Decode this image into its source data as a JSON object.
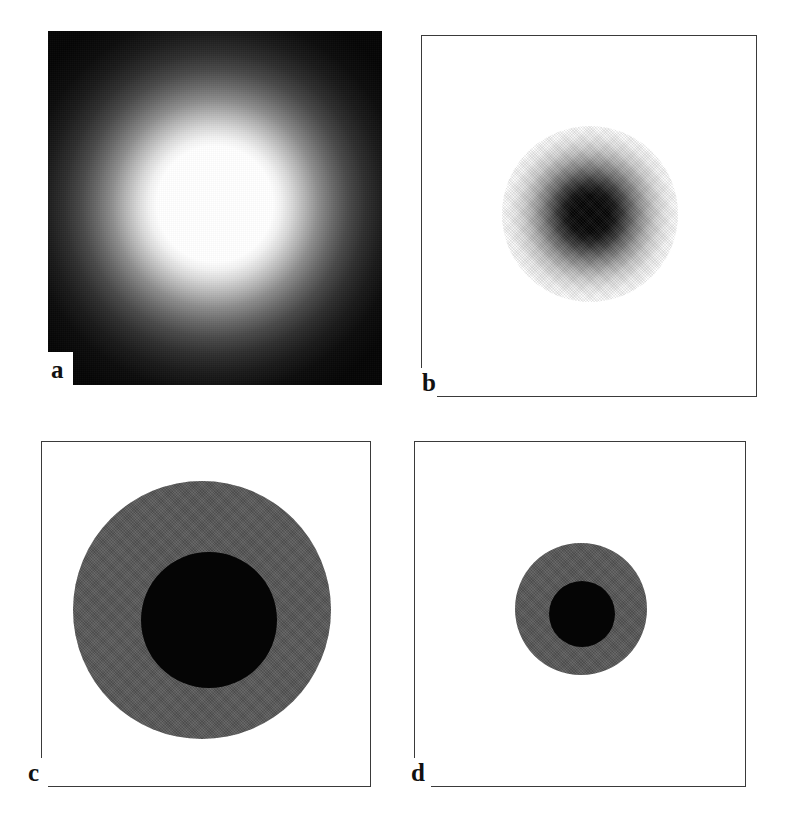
{
  "figure": {
    "panels": [
      {
        "id": "a",
        "label": "a",
        "description": "bright radially-symmetric Gaussian point-spread function rendered white-on-black",
        "background": "#050505",
        "peak_color": "#ffffff"
      },
      {
        "id": "b",
        "label": "b",
        "description": "contrast-inverted Gaussian: dark blob on white background inside a thin black frame",
        "background": "#ffffff",
        "peak_color": "#050505"
      },
      {
        "id": "c",
        "label": "c",
        "description": "two-level quantized disk: large gray annulus enclosing a black core",
        "background": "#ffffff",
        "ring_color": "#585858",
        "core_color": "#050505"
      },
      {
        "id": "d",
        "label": "d",
        "description": "two-level quantized disk at roughly half the radius of panel c",
        "background": "#ffffff",
        "ring_color": "#585858",
        "core_color": "#050505"
      }
    ]
  },
  "chart_data": {
    "type": "heatmap",
    "title": "",
    "xlabel": "",
    "ylabel": "",
    "grid": false,
    "legend": "none",
    "panel_layout": "2 x 2",
    "panels": [
      {
        "label": "a",
        "type": "heatmap",
        "profile": "gaussian",
        "polarity": "positive",
        "colormap": "grayscale",
        "background_level": 0,
        "peak_level": 255,
        "center_xy_px": [
          215,
          204
        ],
        "saturated_core_radius_px": 58,
        "half_max_radius_px": 98,
        "visible_extent_radius_px": 175,
        "frame": "none",
        "radial_profile": {
          "radius_px": [
            0,
            20,
            40,
            58,
            75,
            98,
            120,
            140,
            160,
            175
          ],
          "level": [
            255,
            255,
            255,
            255,
            214,
            128,
            74,
            38,
            16,
            5
          ]
        }
      },
      {
        "label": "b",
        "type": "heatmap",
        "profile": "gaussian",
        "polarity": "inverted",
        "colormap": "grayscale-inverted",
        "background_level": 255,
        "peak_level": 5,
        "center_xy_px": [
          590,
          214
        ],
        "dense_core_radius_px": 27,
        "half_max_radius_px": 44,
        "visible_extent_radius_px": 88,
        "frame": "thin black rectangle",
        "radial_profile": {
          "radius_px": [
            0,
            12,
            20,
            27,
            38,
            50,
            62,
            74,
            88
          ],
          "level": [
            5,
            8,
            22,
            45,
            95,
            150,
            196,
            230,
            255
          ]
        }
      },
      {
        "label": "c",
        "type": "heatmap",
        "profile": "two-level-quantized",
        "polarity": "inverted",
        "background_level": 255,
        "levels": [
          255,
          88,
          5
        ],
        "center_xy_px": [
          201,
          609
        ],
        "outer_radius_px": 129,
        "inner_radius_px": 68,
        "frame": "thin black rectangle"
      },
      {
        "label": "d",
        "type": "heatmap",
        "profile": "two-level-quantized",
        "polarity": "inverted",
        "background_level": 255,
        "levels": [
          255,
          88,
          5
        ],
        "center_xy_px": [
          580,
          608
        ],
        "outer_radius_px": 66,
        "inner_radius_px": 33,
        "frame": "thin black rectangle"
      }
    ]
  }
}
